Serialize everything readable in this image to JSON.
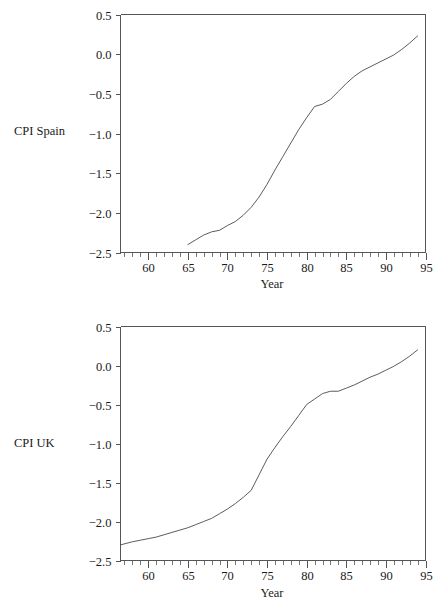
{
  "figure": {
    "background_color": "#ffffff",
    "line_color": "#4a4a4a",
    "axis_color": "#555555",
    "text_color": "#1a1a1a"
  },
  "panels": [
    {
      "id": "spain",
      "series_label": "CPI Spain",
      "xlabel": "Year",
      "x_tick_labels": [
        "60",
        "65",
        "70",
        "75",
        "80",
        "85",
        "90",
        "95"
      ],
      "y_tick_labels": [
        "0.5",
        "0.0",
        "−0.5",
        "−1.0",
        "−1.5",
        "−2.0",
        "−2.5"
      ]
    },
    {
      "id": "uk",
      "series_label": "CPI UK",
      "xlabel": "Year",
      "x_tick_labels": [
        "60",
        "65",
        "70",
        "75",
        "80",
        "85",
        "90",
        "95"
      ],
      "y_tick_labels": [
        "0.5",
        "0.0",
        "−0.5",
        "−1.0",
        "−1.5",
        "−2.0",
        "−2.5"
      ]
    }
  ],
  "chart_data": [
    {
      "type": "line",
      "title": "",
      "xlabel": "Year",
      "ylabel": "CPI Spain",
      "xlim": [
        56.5,
        95
      ],
      "ylim": [
        -2.5,
        0.5
      ],
      "x_ticks": [
        60,
        65,
        70,
        75,
        80,
        85,
        90,
        95
      ],
      "x_tick_labels": [
        "60",
        "65",
        "70",
        "75",
        "80",
        "85",
        "90",
        "95"
      ],
      "y_ticks": [
        0.5,
        0.0,
        -0.5,
        -1.0,
        -1.5,
        -2.0,
        -2.5
      ],
      "y_tick_labels": [
        "0.5",
        "0.0",
        "−0.5",
        "−1.0",
        "−1.5",
        "−2.0",
        "−2.5"
      ],
      "minor_x_tick_interval": 1,
      "grid": false,
      "legend": "none",
      "series": [
        {
          "name": "CPI Spain",
          "x": [
            65,
            66,
            67,
            68,
            69,
            70,
            71,
            72,
            73,
            74,
            75,
            76,
            77,
            78,
            79,
            80,
            81,
            82,
            83,
            84,
            85,
            86,
            87,
            88,
            89,
            90,
            91,
            92,
            93,
            94
          ],
          "y": [
            -2.4,
            -2.34,
            -2.28,
            -2.24,
            -2.22,
            -2.16,
            -2.11,
            -2.03,
            -1.93,
            -1.8,
            -1.64,
            -1.46,
            -1.29,
            -1.12,
            -0.95,
            -0.8,
            -0.66,
            -0.63,
            -0.57,
            -0.47,
            -0.37,
            -0.28,
            -0.21,
            -0.16,
            -0.11,
            -0.06,
            -0.01,
            0.06,
            0.14,
            0.23
          ]
        }
      ]
    },
    {
      "type": "line",
      "title": "",
      "xlabel": "Year",
      "ylabel": "CPI UK",
      "xlim": [
        56.5,
        95
      ],
      "ylim": [
        -2.5,
        0.5
      ],
      "x_ticks": [
        60,
        65,
        70,
        75,
        80,
        85,
        90,
        95
      ],
      "x_tick_labels": [
        "60",
        "65",
        "70",
        "75",
        "80",
        "85",
        "90",
        "95"
      ],
      "y_ticks": [
        0.5,
        0.0,
        -0.5,
        -1.0,
        -1.5,
        -2.0,
        -2.5
      ],
      "y_tick_labels": [
        "0.5",
        "0.0",
        "−0.5",
        "−1.0",
        "−1.5",
        "−2.0",
        "−2.5"
      ],
      "minor_x_tick_interval": 1,
      "grid": false,
      "legend": "none",
      "series": [
        {
          "name": "CPI UK",
          "x": [
            56.5,
            58,
            59,
            60,
            61,
            62,
            63,
            64,
            65,
            66,
            67,
            68,
            69,
            70,
            71,
            72,
            73,
            74,
            75,
            76,
            77,
            78,
            79,
            80,
            81,
            82,
            83,
            84,
            85,
            86,
            87,
            88,
            89,
            90,
            91,
            92,
            93,
            94
          ],
          "y": [
            -2.3,
            -2.26,
            -2.24,
            -2.22,
            -2.2,
            -2.17,
            -2.14,
            -2.11,
            -2.08,
            -2.04,
            -2.0,
            -1.96,
            -1.9,
            -1.84,
            -1.77,
            -1.69,
            -1.6,
            -1.4,
            -1.2,
            -1.05,
            -0.91,
            -0.78,
            -0.64,
            -0.5,
            -0.43,
            -0.36,
            -0.33,
            -0.33,
            -0.29,
            -0.25,
            -0.2,
            -0.15,
            -0.11,
            -0.06,
            -0.01,
            0.05,
            0.12,
            0.2
          ]
        }
      ]
    }
  ]
}
